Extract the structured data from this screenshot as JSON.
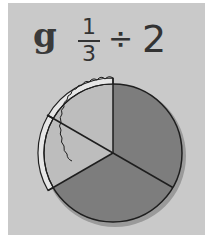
{
  "problem": {
    "label": "g",
    "fraction": {
      "numerator": "1",
      "denominator": "3"
    },
    "operator": "÷",
    "divisor": "2"
  },
  "pie": {
    "total_slices": 3,
    "pieces_after_division": 2,
    "highlighted_slices": "one third split into two halves (with crust)",
    "colors": {
      "dark_fill": "#7d7d7d",
      "light_fill": "#bdbdbd",
      "crust": "#e6e6e6",
      "outline": "#1e1e1e",
      "panel_bg": "#c9c9c9"
    }
  }
}
